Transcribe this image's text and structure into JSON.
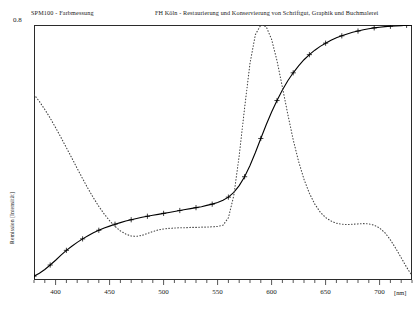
{
  "header": {
    "title_left": "SPM100 - Farbmessung",
    "title_right": "FH Köln - Restaurierung und Konservierung von Schriftgut, Graphik und Buchmalerei"
  },
  "chart_data": {
    "type": "line",
    "title": "SPM100 - Farbmessung",
    "subtitle": "FH Köln - Restaurierung und Konservierung von Schriftgut, Graphik und Buchmalerei",
    "xlabel": "[nm]",
    "ylabel": "Remission [Intensität]",
    "xlim": [
      380,
      730
    ],
    "ylim": [
      0,
      0.8
    ],
    "grid": false,
    "legend": "none",
    "xticks": [
      400,
      450,
      500,
      550,
      600,
      650,
      700
    ],
    "xtick_labels": [
      "400",
      "450",
      "500",
      "550",
      "600",
      "650",
      "700"
    ],
    "xminor_step": 10,
    "yticks": [
      0.8
    ],
    "ytick_labels": [
      "0.8"
    ],
    "x_unit": "[nm]",
    "series": [
      {
        "name": "Remission",
        "style": "solid",
        "color": "#000000",
        "marker": "plus",
        "marker_step": 3,
        "x": [
          380,
          385,
          390,
          395,
          400,
          405,
          410,
          415,
          420,
          425,
          430,
          435,
          440,
          445,
          450,
          455,
          460,
          465,
          470,
          475,
          480,
          485,
          490,
          495,
          500,
          505,
          510,
          515,
          520,
          525,
          530,
          535,
          540,
          545,
          550,
          555,
          560,
          565,
          570,
          575,
          580,
          585,
          590,
          595,
          600,
          605,
          610,
          615,
          620,
          625,
          630,
          635,
          640,
          645,
          650,
          655,
          660,
          665,
          670,
          675,
          680,
          685,
          690,
          695,
          700,
          705,
          710,
          715,
          720,
          725,
          730
        ],
        "y": [
          0.012,
          0.021,
          0.033,
          0.047,
          0.062,
          0.078,
          0.093,
          0.106,
          0.118,
          0.129,
          0.139,
          0.148,
          0.156,
          0.163,
          0.169,
          0.175,
          0.18,
          0.185,
          0.189,
          0.193,
          0.197,
          0.2,
          0.203,
          0.206,
          0.209,
          0.212,
          0.215,
          0.218,
          0.221,
          0.224,
          0.227,
          0.23,
          0.234,
          0.238,
          0.243,
          0.25,
          0.26,
          0.275,
          0.296,
          0.324,
          0.359,
          0.4,
          0.444,
          0.487,
          0.527,
          0.563,
          0.596,
          0.625,
          0.65,
          0.672,
          0.691,
          0.707,
          0.721,
          0.733,
          0.743,
          0.752,
          0.76,
          0.766,
          0.772,
          0.777,
          0.781,
          0.785,
          0.788,
          0.791,
          0.793,
          0.795,
          0.796,
          0.797,
          0.798,
          0.799,
          0.8
        ]
      },
      {
        "name": "Normfarbwert / Referenzkurve",
        "style": "dotted",
        "color": "#444444",
        "marker": "none",
        "x": [
          380,
          385,
          390,
          395,
          400,
          405,
          410,
          415,
          420,
          425,
          430,
          435,
          440,
          445,
          450,
          455,
          460,
          465,
          470,
          475,
          480,
          485,
          490,
          495,
          500,
          505,
          510,
          515,
          520,
          525,
          530,
          535,
          540,
          545,
          550,
          555,
          560,
          565,
          570,
          575,
          580,
          585,
          590,
          595,
          600,
          605,
          610,
          615,
          620,
          625,
          630,
          635,
          640,
          645,
          650,
          655,
          660,
          665,
          670,
          675,
          680,
          685,
          690,
          695,
          700,
          705,
          710,
          715,
          720,
          725,
          730
        ],
        "y": [
          0.582,
          0.56,
          0.535,
          0.508,
          0.478,
          0.447,
          0.415,
          0.383,
          0.35,
          0.318,
          0.287,
          0.258,
          0.231,
          0.207,
          0.186,
          0.168,
          0.154,
          0.144,
          0.138,
          0.137,
          0.14,
          0.146,
          0.152,
          0.157,
          0.16,
          0.162,
          0.163,
          0.164,
          0.164,
          0.165,
          0.165,
          0.166,
          0.166,
          0.167,
          0.168,
          0.172,
          0.195,
          0.265,
          0.39,
          0.54,
          0.68,
          0.77,
          0.8,
          0.795,
          0.755,
          0.688,
          0.605,
          0.52,
          0.44,
          0.372,
          0.316,
          0.272,
          0.238,
          0.213,
          0.196,
          0.185,
          0.178,
          0.175,
          0.174,
          0.175,
          0.176,
          0.177,
          0.176,
          0.172,
          0.163,
          0.148,
          0.126,
          0.099,
          0.07,
          0.04,
          0.014
        ]
      }
    ]
  }
}
